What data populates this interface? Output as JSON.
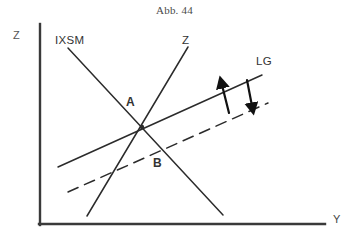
{
  "figure": {
    "title": "Abb. 44",
    "axes": {
      "y_axis_label": "Z",
      "x_axis_label": "Y"
    },
    "curves": [
      {
        "id": "ixsm",
        "label": "IXSM",
        "style": "solid",
        "direction": "downward-sloping"
      },
      {
        "id": "z",
        "label": "Z",
        "style": "solid",
        "direction": "upward-sloping"
      },
      {
        "id": "lg",
        "label": "LG",
        "style": "solid",
        "direction": "upward-sloping-shallow"
      },
      {
        "id": "lg-shifted",
        "label": "",
        "style": "dashed",
        "direction": "upward-sloping-shallow"
      }
    ],
    "points": [
      {
        "id": "a",
        "label": "A"
      },
      {
        "id": "b",
        "label": "B"
      }
    ],
    "annotations": [
      {
        "id": "arrow-up",
        "label": "",
        "direction": "up"
      },
      {
        "id": "arrow-down",
        "label": "",
        "direction": "down"
      }
    ],
    "colors": {
      "ink": "#2b2b2b",
      "axis": "#3a3a3a",
      "background": "#ffffff"
    }
  }
}
